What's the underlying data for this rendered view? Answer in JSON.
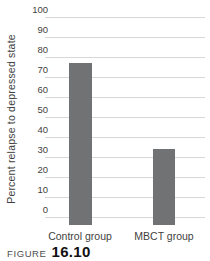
{
  "figure": {
    "label": "FIGURE",
    "number": "16.10"
  },
  "chart_data": {
    "type": "bar",
    "categories": [
      "Control group",
      "MBCT group"
    ],
    "values": [
      77,
      34
    ],
    "title": "",
    "xlabel": "",
    "ylabel": "Percent relapse to depressed state",
    "ylim": [
      0,
      100
    ],
    "yticks": [
      100,
      90,
      80,
      70,
      60,
      50,
      40,
      30,
      20,
      10,
      0
    ],
    "grid": true,
    "legend": false,
    "bar_color": "#717274",
    "gridline_color": "#d7d7d7",
    "text_color": "#3f3f41"
  }
}
